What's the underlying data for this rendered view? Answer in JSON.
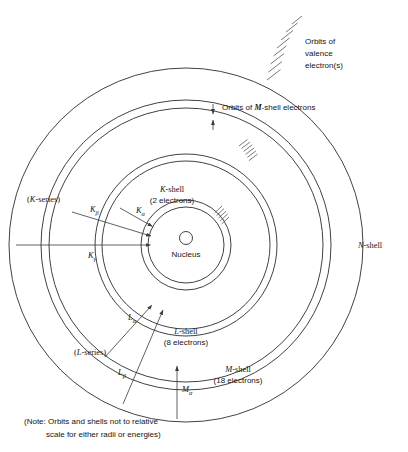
{
  "figure": {
    "type": "diagram",
    "note": {
      "line1": "(Note: Orbits and shells not to relative",
      "line2": "scale for either radii or energies)"
    },
    "colors": {
      "background": "#ffffff",
      "ink": "#2b2b2b",
      "ray": "#3a3a3a",
      "text": "#141414"
    }
  },
  "shells": [
    {
      "id": "nucleus",
      "label": "Nucleus",
      "electrons": null
    },
    {
      "id": "k-shell",
      "name": "K",
      "label_line1": "K-shell",
      "label_line2": "(2 electrons)",
      "electrons": 2
    },
    {
      "id": "l-shell",
      "name": "L",
      "label_line1": "L-shell",
      "label_line2": "(8 electrons)",
      "electrons": 8
    },
    {
      "id": "m-shell",
      "name": "M",
      "label_line1": "M-shell",
      "label_line2": "(18 electrons)",
      "electrons": 18
    },
    {
      "id": "n-shell",
      "name": "N",
      "label_line1": "N-shell",
      "label_line2": "",
      "electrons": null
    }
  ],
  "callouts": {
    "m_orbits": {
      "text_pre": "Orbits of ",
      "text_ital": "M",
      "text_post": "-shell electrons"
    },
    "valence": {
      "line1": "Orbits of",
      "line2": "valence",
      "line3": "electron(s)"
    }
  },
  "series": {
    "k": {
      "label": "(K-series)",
      "label_ital": "K",
      "label_pre": "(",
      "label_post": "-series)",
      "transitions": [
        {
          "id": "k-alpha",
          "base": "K",
          "greek": "α"
        },
        {
          "id": "k-beta",
          "base": "K",
          "greek": "β"
        },
        {
          "id": "k-gamma",
          "base": "K",
          "greek": "γ"
        }
      ]
    },
    "l": {
      "label_pre": "(",
      "label_ital": "L",
      "label_post": "-series)",
      "transitions": [
        {
          "id": "l-alpha",
          "base": "L",
          "greek": "α"
        },
        {
          "id": "l-beta",
          "base": "L",
          "greek": "β"
        }
      ]
    },
    "m": {
      "transitions": [
        {
          "id": "m-alpha",
          "base": "M",
          "greek": "α"
        }
      ]
    }
  }
}
